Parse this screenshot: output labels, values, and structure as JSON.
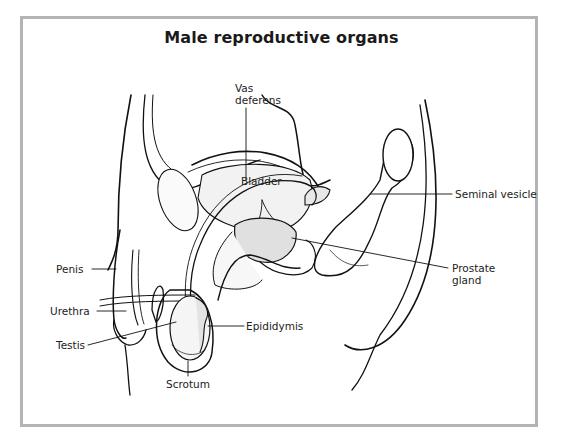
{
  "figure": {
    "title": "Male reproductive organs",
    "border_color": "#b3b3b3",
    "line_color": "#111111"
  },
  "labels": {
    "vas_deferens_line1": "Vas",
    "vas_deferens_line2": "deferens",
    "bladder": "Bladder",
    "seminal_vesicle": "Seminal vesicle",
    "prostate_line1": "Prostate",
    "prostate_line2": "gland",
    "penis": "Penis",
    "urethra": "Urethra",
    "epididymis": "Epididymis",
    "testis": "Testis",
    "scrotum": "Scrotum"
  }
}
